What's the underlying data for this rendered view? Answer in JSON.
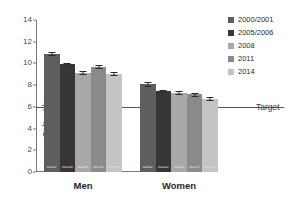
{
  "chart_data": {
    "type": "bar",
    "title": "",
    "subtitle": "",
    "xlabel": "",
    "ylabel": "Salt, g/day",
    "ylim": [
      0,
      14
    ],
    "ytick_values": [
      0,
      2,
      4,
      6,
      8,
      10,
      12,
      14
    ],
    "ytick_labels": [
      "0",
      "2",
      "4",
      "6",
      "8",
      "10",
      "12",
      "14"
    ],
    "grid": false,
    "legend_position": "right",
    "categories": [
      "Men",
      "Women"
    ],
    "series": [
      {
        "name": "2000/2001",
        "color": "#5e5e5e",
        "values": [
          10.9,
          8.1
        ],
        "errors": [
          0.15,
          0.15
        ],
        "n_labels": [
          "n=567",
          "n=682"
        ]
      },
      {
        "name": "2005/2006",
        "color": "#363636",
        "values": [
          9.95,
          7.45
        ],
        "errors": [
          0.13,
          0.12
        ],
        "n_labels": [
          "N=186",
          "N=242"
        ]
      },
      {
        "name": "2008",
        "color": "#a8a8a8",
        "values": [
          9.15,
          7.3
        ],
        "errors": [
          0.12,
          0.12
        ],
        "n_labels": [
          "N=234",
          "N=198"
        ]
      },
      {
        "name": "2011",
        "color": "#8a8a8a",
        "values": [
          9.7,
          7.15
        ],
        "errors": [
          0.15,
          0.13
        ],
        "n_labels": [
          "N=259",
          "N=297"
        ]
      },
      {
        "name": "2014",
        "color": "#c4c4c4",
        "values": [
          9.05,
          6.75
        ],
        "errors": [
          0.13,
          0.14
        ],
        "n_labels": [
          "N=198",
          "N=292"
        ]
      }
    ],
    "reference_line": {
      "label": "Target",
      "value": 6,
      "color": "#555555"
    }
  },
  "legend": {
    "items": [
      {
        "label": "2000/2001",
        "color": "#5e5e5e"
      },
      {
        "label": "2005/2006",
        "color": "#363636"
      },
      {
        "label": "2008",
        "color": "#a8a8a8"
      },
      {
        "label": "2011",
        "color": "#8a8a8a"
      },
      {
        "label": "2014",
        "color": "#c4c4c4"
      }
    ]
  }
}
